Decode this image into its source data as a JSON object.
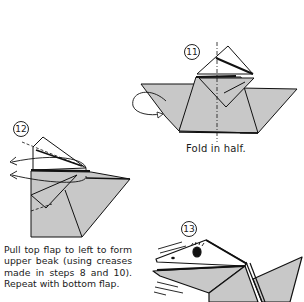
{
  "colors": {
    "paper_fill": "#c8c8c8",
    "outline": "#111111",
    "background": "#ffffff"
  },
  "steps": [
    {
      "number": "11",
      "caption": "Fold in half."
    },
    {
      "number": "12",
      "caption": "Pull top flap to left to form upper beak (using creases made in steps 8 and 10). Repeat with bottom flap."
    },
    {
      "number": "13",
      "caption": ""
    }
  ]
}
